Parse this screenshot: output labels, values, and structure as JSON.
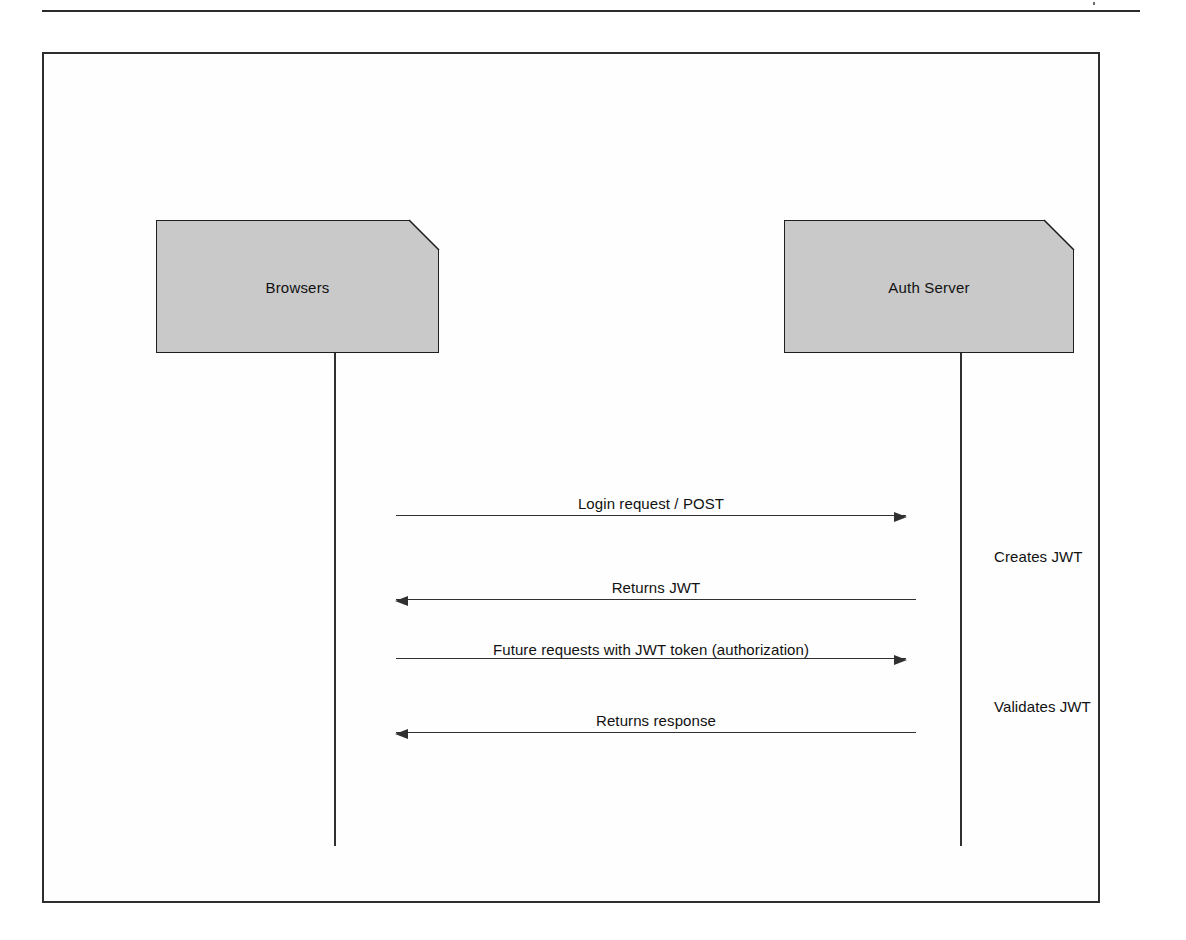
{
  "page": {
    "background_color": "#ffffff",
    "header_rule_color": "#2b2b2b"
  },
  "frame": {
    "border_color": "#2e2e2e",
    "fill_color": "#fefefe"
  },
  "diagram": {
    "type": "uml-sequence-diagram",
    "participant_fill_color": "#c9c9c9",
    "participant_border_color": "#1f1f1f",
    "line_color": "#303030",
    "participants": [
      {
        "id": "browsers",
        "label": "Browsers"
      },
      {
        "id": "auth_server",
        "label": "Auth Server"
      }
    ],
    "messages": [
      {
        "index": 1,
        "label": "Login request / POST",
        "from": "browsers",
        "to": "auth_server",
        "direction": "right"
      },
      {
        "index": 2,
        "label": "Returns JWT",
        "from": "auth_server",
        "to": "browsers",
        "direction": "left"
      },
      {
        "index": 3,
        "label": "Future requests with JWT token (authorization)",
        "from": "browsers",
        "to": "auth_server",
        "direction": "right"
      },
      {
        "index": 4,
        "label": "Returns response",
        "from": "auth_server",
        "to": "browsers",
        "direction": "left"
      }
    ],
    "annotations": [
      {
        "id": "creates_jwt",
        "label": "Creates JWT",
        "attached_to": "auth_server",
        "after_message": 1
      },
      {
        "id": "validates_jwt",
        "label": "Validates JWT",
        "attached_to": "auth_server",
        "after_message": 3
      }
    ]
  }
}
